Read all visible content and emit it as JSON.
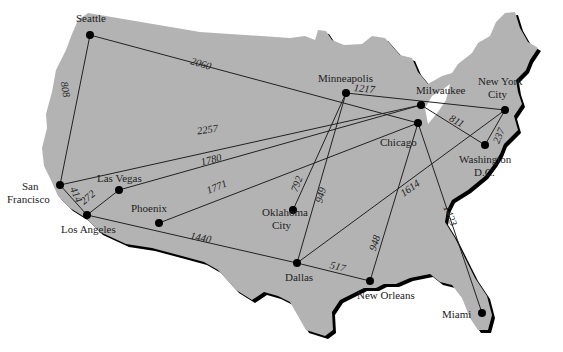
{
  "map": {
    "land_color": "#b3b3b3",
    "shadow_color": "#000000",
    "cities": [
      {
        "id": "seattle",
        "name": [
          "Seattle"
        ],
        "x": 90,
        "y": 35,
        "lx": 76,
        "ly": 22,
        "anchor": "start"
      },
      {
        "id": "sanfrancisco",
        "name": [
          "San",
          "Francisco"
        ],
        "x": 60,
        "y": 185,
        "lx": 22,
        "ly": 190,
        "anchor": "start"
      },
      {
        "id": "lasvegas",
        "name": [
          "Las Vegas"
        ],
        "x": 119,
        "y": 190,
        "lx": 97,
        "ly": 182,
        "anchor": "start"
      },
      {
        "id": "losangeles",
        "name": [
          "Los Angeles"
        ],
        "x": 87,
        "y": 215,
        "lx": 61,
        "ly": 233,
        "anchor": "start"
      },
      {
        "id": "phoenix",
        "name": [
          "Phoenix"
        ],
        "x": 159,
        "y": 223,
        "lx": 131,
        "ly": 212,
        "anchor": "start"
      },
      {
        "id": "oklahomacity",
        "name": [
          "Oklahoma",
          "City"
        ],
        "x": 293,
        "y": 210,
        "lx": 262,
        "ly": 216,
        "anchor": "start"
      },
      {
        "id": "minneapolis",
        "name": [
          "Minneapolis"
        ],
        "x": 346,
        "y": 93,
        "lx": 318,
        "ly": 82,
        "anchor": "start"
      },
      {
        "id": "milwaukee",
        "name": [
          "Milwaukee"
        ],
        "x": 421,
        "y": 105,
        "lx": 416,
        "ly": 94,
        "anchor": "start"
      },
      {
        "id": "chicago",
        "name": [
          "Chicago"
        ],
        "x": 418,
        "y": 123,
        "lx": 380,
        "ly": 146,
        "anchor": "start"
      },
      {
        "id": "newyork",
        "name": [
          "New York",
          "City"
        ],
        "x": 505,
        "y": 110,
        "lx": 478,
        "ly": 85,
        "anchor": "start"
      },
      {
        "id": "washington",
        "name": [
          "Washington",
          "D.C."
        ],
        "x": 485,
        "y": 145,
        "lx": 459,
        "ly": 163,
        "anchor": "start"
      },
      {
        "id": "dallas",
        "name": [
          "Dallas"
        ],
        "x": 297,
        "y": 263,
        "lx": 285,
        "ly": 281,
        "anchor": "start"
      },
      {
        "id": "neworleans",
        "name": [
          "New Orleans"
        ],
        "x": 370,
        "y": 281,
        "lx": 357,
        "ly": 299,
        "anchor": "start"
      },
      {
        "id": "miami",
        "name": [
          "Miami"
        ],
        "x": 482,
        "y": 313,
        "lx": 442,
        "ly": 318,
        "anchor": "start"
      }
    ],
    "routes": [
      {
        "from": "seattle",
        "to": "sanfrancisco",
        "distance": "808",
        "lx": 62,
        "ly": 90,
        "rot": 80
      },
      {
        "from": "seattle",
        "to": "chicago",
        "distance": "2060",
        "lx": 200,
        "ly": 67,
        "rot": 16
      },
      {
        "from": "sanfrancisco",
        "to": "milwaukee",
        "distance": "2257",
        "lx": 208,
        "ly": 133,
        "rot": -8
      },
      {
        "from": "sanfrancisco",
        "to": "losangeles",
        "distance": "414",
        "lx": 73,
        "ly": 196,
        "rot": 65
      },
      {
        "from": "lasvegas",
        "to": "losangeles",
        "distance": "272",
        "lx": 90,
        "ly": 200,
        "rot": -40
      },
      {
        "from": "lasvegas",
        "to": "milwaukee",
        "distance": "1780",
        "lx": 212,
        "ly": 163,
        "rot": -14
      },
      {
        "from": "phoenix",
        "to": "chicago",
        "distance": "1771",
        "lx": 218,
        "ly": 190,
        "rot": -22
      },
      {
        "from": "minneapolis",
        "to": "oklahomacity",
        "distance": "792",
        "lx": 300,
        "ly": 185,
        "rot": -70
      },
      {
        "from": "minneapolis",
        "to": "dallas",
        "distance": "949",
        "lx": 324,
        "ly": 196,
        "rot": -75
      },
      {
        "from": "minneapolis",
        "to": "newyork",
        "distance": "1217",
        "lx": 364,
        "ly": 92,
        "rot": 6
      },
      {
        "from": "milwaukee",
        "to": "washington",
        "distance": "811",
        "lx": 455,
        "ly": 124,
        "rot": 30
      },
      {
        "from": "newyork",
        "to": "washington",
        "distance": "237",
        "lx": 502,
        "ly": 137,
        "rot": -68
      },
      {
        "from": "dallas",
        "to": "newyork",
        "distance": "1614",
        "lx": 412,
        "ly": 191,
        "rot": -35
      },
      {
        "from": "neworleans",
        "to": "chicago",
        "distance": "948",
        "lx": 378,
        "ly": 244,
        "rot": -72
      },
      {
        "from": "chicago",
        "to": "miami",
        "distance": "1423",
        "lx": 447,
        "ly": 217,
        "rot": 68
      },
      {
        "from": "losangeles",
        "to": "dallas",
        "distance": "1440",
        "lx": 200,
        "ly": 241,
        "rot": 12
      },
      {
        "from": "dallas",
        "to": "neworleans",
        "distance": "517",
        "lx": 337,
        "ly": 270,
        "rot": 14
      }
    ]
  }
}
